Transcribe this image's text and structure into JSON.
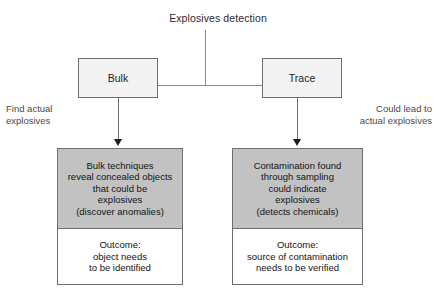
{
  "diagram": {
    "title": "Explosives detection",
    "branches": [
      {
        "label": "Bulk",
        "side_note": "Find actual\nexplosives",
        "description": "Bulk techniques\nreveal concealed objects\nthat could be\nexplosives\n(discover anomalies)",
        "outcome": "Outcome:\nobject needs\nto be identified"
      },
      {
        "label": "Trace",
        "side_note": "Could lead to\nactual explosives",
        "description": "Contamination found\nthrough sampling\ncould indicate\nexplosives\n(detects chemicals)",
        "outcome": "Outcome:\nsource of contamination\nneeds to be verified"
      }
    ],
    "colors": {
      "background": "#ffffff",
      "box_fill_light": "#f3f3f3",
      "panel_fill_gray": "#c2c2c2",
      "panel_fill_white": "#ffffff",
      "border": "#6e6e6e",
      "connector": "#8a8a8a",
      "arrow_head": "#1a1a1a",
      "text": "#141414",
      "side_note_text": "#4a4a4a"
    }
  }
}
